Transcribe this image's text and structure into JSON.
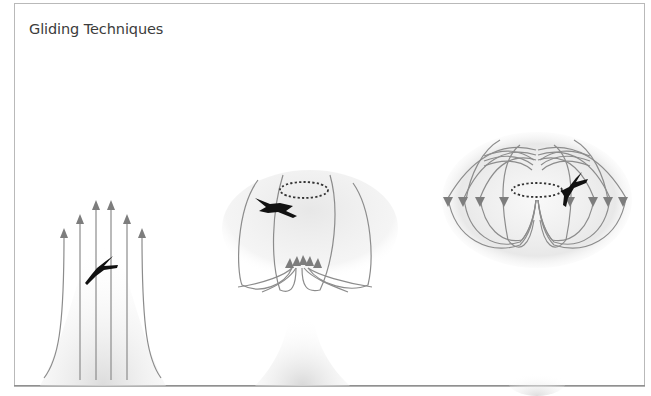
{
  "title": "Gliding Techniques",
  "colors": {
    "frame_border": "#b9b9b9",
    "line": "#8a8a8a",
    "arrow": "#7d7d7d",
    "bird": "#111111",
    "haze": "#dcdcdc",
    "ground": "#555555",
    "title_text": "#3c3c3c"
  },
  "panels": [
    {
      "id": "thermal-column",
      "description": "Rising air column with six upward arrows and a soaring bird",
      "arrow_count": 6,
      "arrow_direction": "up"
    },
    {
      "id": "thermal-bubble",
      "description": "Mushroom-shaped thermal bubble with looping streamlines, converging upward arrows, a dashed circling ring and a bird",
      "arrow_count": 5,
      "arrow_direction": "up-converging"
    },
    {
      "id": "vortex-ring",
      "description": "Toroidal vortex ring with downward-pointing arrows, a dashed central ring and a bird",
      "arrow_count": 8,
      "arrow_direction": "down"
    }
  ]
}
